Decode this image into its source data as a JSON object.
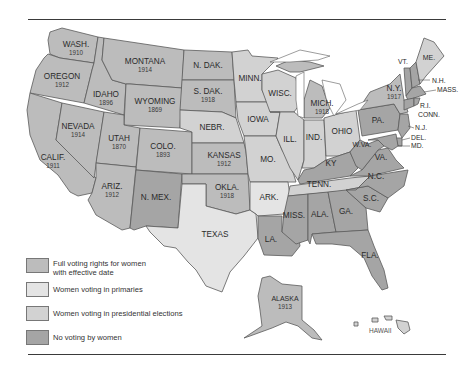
{
  "colors": {
    "full": "#bcbcbc",
    "primaries": "#e4e4e4",
    "presidential": "#d2d2d2",
    "none": "#a5a5a5",
    "water": "#ffffff"
  },
  "states": {
    "wash": {
      "label": "WASH.",
      "year": "1910"
    },
    "oregon": {
      "label": "OREGON",
      "year": "1912"
    },
    "calif": {
      "label": "CALIF.",
      "year": "1911"
    },
    "idaho": {
      "label": "IDAHO",
      "year": "1896"
    },
    "nevada": {
      "label": "NEVADA",
      "year": "1914"
    },
    "montana": {
      "label": "MONTANA",
      "year": "1914"
    },
    "wyoming": {
      "label": "WYOMING",
      "year": "1869"
    },
    "utah": {
      "label": "UTAH",
      "year": "1870"
    },
    "colo": {
      "label": "COLO.",
      "year": "1893"
    },
    "ariz": {
      "label": "ARIZ.",
      "year": "1912"
    },
    "nmex": {
      "label": "N. MEX."
    },
    "ndak": {
      "label": "N. DAK."
    },
    "sdak": {
      "label": "S. DAK.",
      "year": "1918"
    },
    "nebr": {
      "label": "NEBR."
    },
    "kansas": {
      "label": "KANSAS",
      "year": "1912"
    },
    "okla": {
      "label": "OKLA.",
      "year": "1918"
    },
    "texas": {
      "label": "TEXAS"
    },
    "minn": {
      "label": "MINN."
    },
    "iowa": {
      "label": "IOWA"
    },
    "mo": {
      "label": "MO."
    },
    "ark": {
      "label": "ARK."
    },
    "la": {
      "label": "LA."
    },
    "wisc": {
      "label": "WISC."
    },
    "ill": {
      "label": "ILL."
    },
    "mich": {
      "label": "MICH.",
      "year": "1918"
    },
    "ind": {
      "label": "IND."
    },
    "ohio": {
      "label": "OHIO"
    },
    "ky": {
      "label": "KY"
    },
    "tenn": {
      "label": "TENN."
    },
    "miss": {
      "label": "MISS."
    },
    "ala": {
      "label": "ALA."
    },
    "ga": {
      "label": "GA."
    },
    "fla": {
      "label": "FLA."
    },
    "sc": {
      "label": "S.C."
    },
    "nc": {
      "label": "N.C."
    },
    "va": {
      "label": "VA."
    },
    "wva": {
      "label": "W.VA."
    },
    "pa": {
      "label": "PA."
    },
    "ny": {
      "label": "N.Y.",
      "year": "1917"
    },
    "vt": {
      "label": "VT."
    },
    "me": {
      "label": "ME."
    },
    "nh": {
      "label": "N.H."
    },
    "mass": {
      "label": "MASS."
    },
    "ri": {
      "label": "R.I."
    },
    "conn": {
      "label": "CONN."
    },
    "nj": {
      "label": "N.J."
    },
    "del": {
      "label": "DEL."
    },
    "md": {
      "label": "MD."
    },
    "alaska": {
      "label": "ALASKA",
      "year": "1913"
    },
    "hawaii": {
      "label": "HAWAII"
    }
  },
  "legend": {
    "items": [
      {
        "key": "full",
        "label": "Full voting rights for women with effective date",
        "line1": "Full voting rights for women",
        "line2": "with effective date"
      },
      {
        "key": "primaries",
        "label": "Women voting in primaries"
      },
      {
        "key": "presidential",
        "label": "Women voting in presidential elections"
      },
      {
        "key": "none",
        "label": "No voting by women"
      }
    ]
  }
}
